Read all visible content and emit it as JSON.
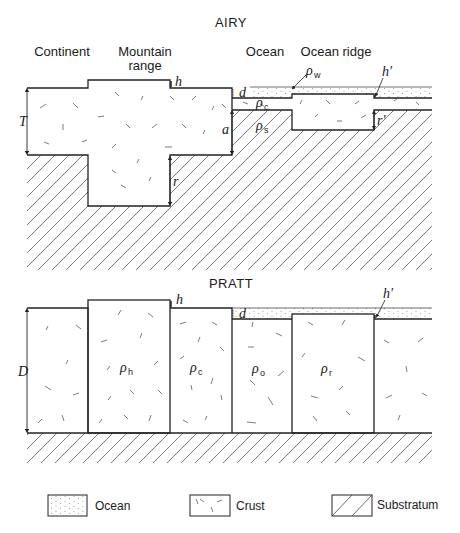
{
  "airy": {
    "title": "AIRY",
    "labels": {
      "continent": "Continent",
      "mountain_line1": "Mountain",
      "mountain_line2": "range",
      "ocean": "Ocean",
      "ocean_ridge": "Ocean ridge"
    },
    "symbols": {
      "h": "h",
      "h_prime": "h′",
      "d": "d",
      "T": "T",
      "a": "a",
      "r": "r",
      "r_prime": "r′",
      "rho": "ρ",
      "rho_w_sub": "w",
      "rho_c_sub": "c",
      "rho_s_sub": "s"
    }
  },
  "pratt": {
    "title": "PRATT",
    "symbols": {
      "h": "h",
      "h_prime": "h′",
      "d": "d",
      "D": "D",
      "rho": "ρ",
      "rho_h_sub": "h",
      "rho_c_sub": "c",
      "rho_o_sub": "o",
      "rho_r_sub": "r"
    }
  },
  "legend": {
    "items": [
      {
        "key": "ocean",
        "label": "Ocean"
      },
      {
        "key": "crust",
        "label": "Crust"
      },
      {
        "key": "substratum",
        "label": "Substratum"
      }
    ]
  }
}
